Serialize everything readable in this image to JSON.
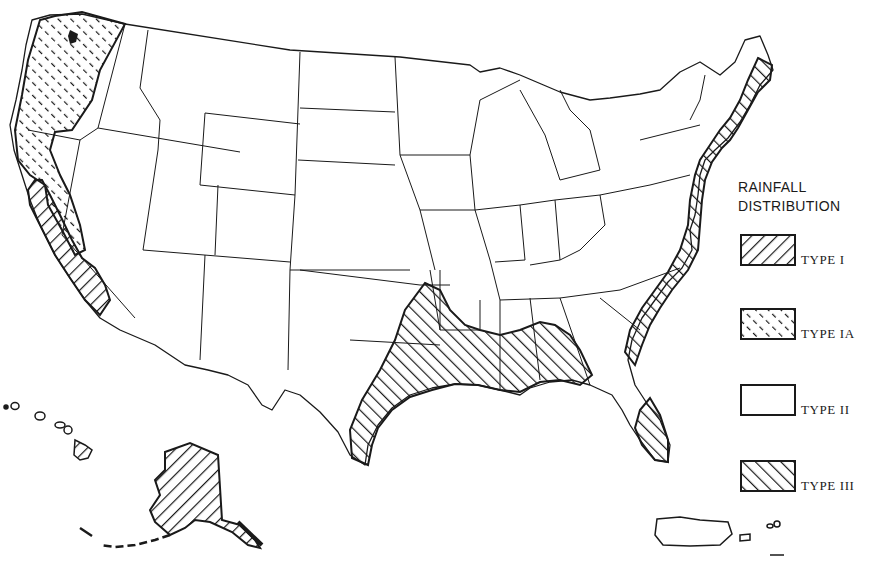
{
  "legend": {
    "title_line1": "RAINFALL",
    "title_line2": "DISTRIBUTION",
    "items": [
      {
        "label": "TYPE I",
        "pattern": "diagonal-forward-hatch"
      },
      {
        "label": "TYPE IA",
        "pattern": "dashed-backward-hatch"
      },
      {
        "label": "TYPE II",
        "pattern": "blank"
      },
      {
        "label": "TYPE III",
        "pattern": "diagonal-backward-hatch"
      }
    ]
  },
  "map": {
    "subject": "United States rainfall distribution types",
    "regions": [
      {
        "area": "Pacific Northwest coast (WA, OR, northern CA)",
        "type": "TYPE IA"
      },
      {
        "area": "Central and southern California coast",
        "type": "TYPE I"
      },
      {
        "area": "Alaska",
        "type": "TYPE I"
      },
      {
        "area": "Hawaii",
        "type": "TYPE I"
      },
      {
        "area": "Gulf Coast (TX, LA, MS, AL, FL panhandle)",
        "type": "TYPE III"
      },
      {
        "area": "Atlantic coast (ME to GA) and southern Florida",
        "type": "TYPE III"
      },
      {
        "area": "Rest of contiguous US and Puerto Rico",
        "type": "TYPE II"
      }
    ]
  },
  "colors": {
    "ink": "#1a1a1a",
    "paper": "#ffffff"
  }
}
